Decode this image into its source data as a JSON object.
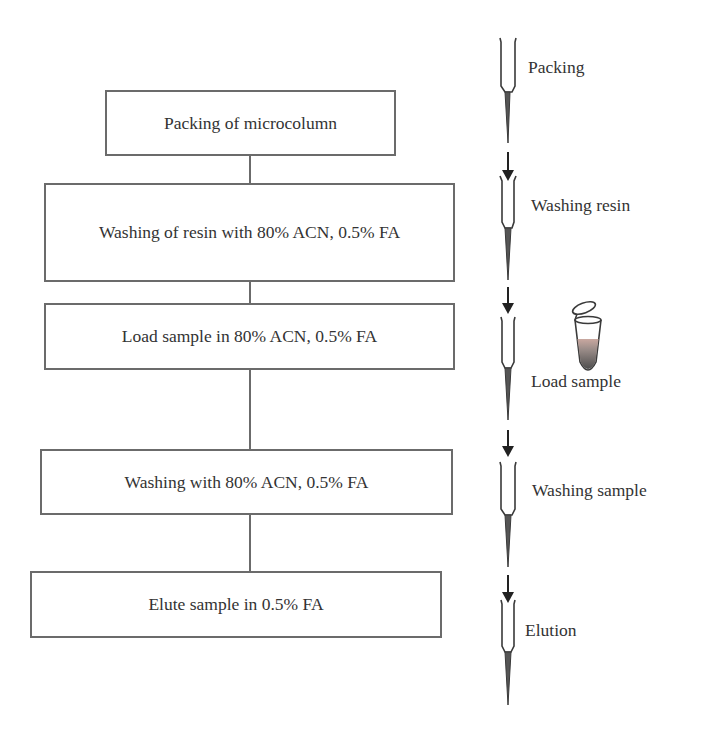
{
  "flowchart": {
    "steps": [
      {
        "label": "Packing of microcolumn"
      },
      {
        "label": "Washing of resin with 80% ACN, 0.5% FA"
      },
      {
        "label": "Load sample in 80% ACN, 0.5% FA"
      },
      {
        "label": "Washing with 80% ACN, 0.5% FA"
      },
      {
        "label": "Elute sample in 0.5%  FA"
      }
    ]
  },
  "illustration": {
    "stages": [
      {
        "label": "Packing",
        "icon": "pipette-tip-icon"
      },
      {
        "label": "Washing resin",
        "icon": "pipette-tip-icon"
      },
      {
        "label": "Load sample",
        "icon": "pipette-tip-icon",
        "extra_icon": "sample-tube-icon"
      },
      {
        "label": "Washing sample",
        "icon": "pipette-tip-icon"
      },
      {
        "label": "Elution",
        "icon": "pipette-tip-icon"
      }
    ],
    "colors": {
      "line": "#3a3a3a",
      "box_border": "#6b6b6b",
      "tube_liquid_top": "#c9a8a0",
      "tube_liquid_bottom": "#5a5a5a"
    }
  }
}
